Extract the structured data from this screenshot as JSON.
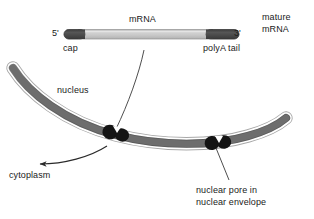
{
  "figure": {
    "background_color": "#ffffff"
  },
  "colors": {
    "mrna_body": "#c9c9c9",
    "mrna_body_edge": "#8a8a8a",
    "mrna_cap": "#4a4a4a",
    "membrane_core": "#6e6e6e",
    "membrane_outline": "#9a9a9a",
    "membrane_highlight": "#ffffff",
    "pore": "#141414",
    "text": "#1a1a1a",
    "leader_line": "#333333"
  },
  "mrna": {
    "title_label": "mRNA",
    "five_prime_label": "5'",
    "three_prime_label": "3'",
    "cap_label": "cap",
    "polya_label": "polyA tail"
  },
  "annotations": {
    "mature_mrna_label": "mature\nmRNA",
    "mature_mrna_line1": "mature",
    "mature_mrna_line2": "mRNA",
    "nucleus_label": "nucleus",
    "cytoplasm_label": "cytoplasm",
    "pore_label_line1": "nuclear pore in",
    "pore_label_line2": "nuclear envelope"
  },
  "structures": {
    "nuclear_envelope_name": "nuclear envelope",
    "pore_left_name": "nuclear pore left",
    "pore_right_name": "nuclear pore right",
    "export_arrow_name": "mRNA export arrow to cytoplasm"
  }
}
